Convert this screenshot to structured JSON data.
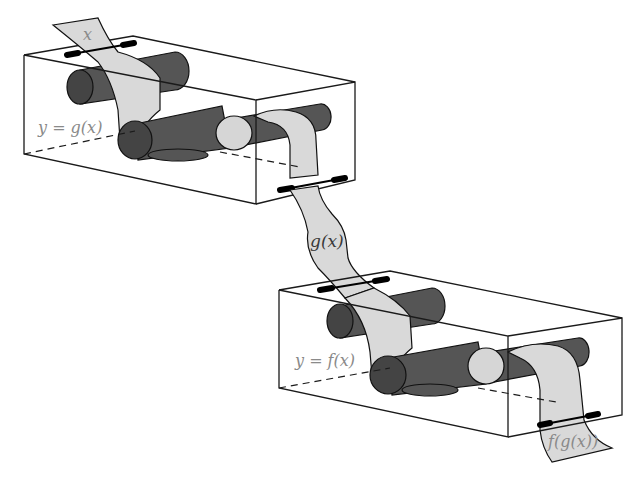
{
  "diagram": {
    "machines": [
      {
        "id": "g",
        "label": "y = g(x)",
        "input": "x",
        "output": "g(x)"
      },
      {
        "id": "f",
        "label": "y = f(x)",
        "input": "g(x)",
        "output": "f(g(x))"
      }
    ],
    "tape_labels": {
      "input": "x",
      "middle": "g(x)",
      "output": "f(g(x))"
    },
    "colors": {
      "tape": "#d9d9d9",
      "roller": "#555555",
      "roller_end": "#444444",
      "label": "#8a8a8a"
    }
  }
}
